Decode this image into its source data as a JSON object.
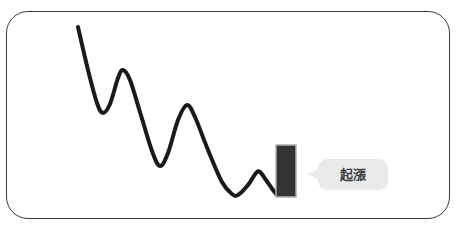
{
  "figure": {
    "frame": {
      "border_color": "#3a3a3a",
      "background_color": "#ffffff"
    },
    "annotation": {
      "label": "起漲",
      "bubble_color": "#e9eaeb",
      "text_color": "#3c3c3c"
    },
    "bar": {
      "fill_color": "#333333",
      "border_color": "#b0b0b0"
    },
    "line": {
      "color": "#1a1a1a",
      "width": 4
    }
  },
  "chart_data": {
    "type": "line",
    "title": "",
    "subtitle": "",
    "xlabel": "",
    "ylabel": "",
    "grid": false,
    "legend": null,
    "axis_visible": false,
    "xlim": [
      70,
      300
    ],
    "ylim": [
      210,
      20
    ],
    "series": [
      {
        "name": "price-wave",
        "points": [
          [
            78,
            27
          ],
          [
            88,
            70
          ],
          [
            97,
            103
          ],
          [
            103,
            113
          ],
          [
            110,
            104
          ],
          [
            118,
            78
          ],
          [
            123,
            70
          ],
          [
            130,
            80
          ],
          [
            140,
            112
          ],
          [
            152,
            151
          ],
          [
            160,
            166
          ],
          [
            168,
            153
          ],
          [
            178,
            120
          ],
          [
            187,
            105
          ],
          [
            195,
            117
          ],
          [
            208,
            150
          ],
          [
            222,
            182
          ],
          [
            232,
            194
          ],
          [
            238,
            195
          ],
          [
            248,
            185
          ],
          [
            256,
            173
          ],
          [
            260,
            172
          ],
          [
            266,
            180
          ],
          [
            273,
            190
          ],
          [
            277,
            195
          ]
        ]
      }
    ],
    "markers": [
      {
        "name": "bullish-candle",
        "shape": "rectangle",
        "x": 276,
        "y": 145,
        "width": 20,
        "height": 52
      }
    ],
    "annotations": [
      {
        "text": "起漲",
        "x": 318,
        "y": 159,
        "points_to": [
          296,
          172
        ]
      }
    ]
  }
}
